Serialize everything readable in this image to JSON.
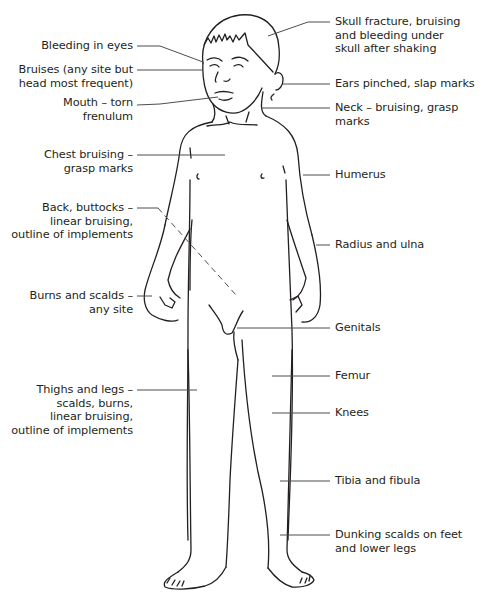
{
  "diagram": {
    "line_color": "#231f20",
    "leader_color": "#4d4d4d",
    "left_labels": [
      {
        "id": "bleeding-in-eyes",
        "lines": [
          "Bleeding in eyes"
        ]
      },
      {
        "id": "bruises",
        "lines": [
          "Bruises (any site but",
          "head most frequent)"
        ]
      },
      {
        "id": "mouth",
        "lines": [
          "Mouth – torn",
          "frenulum"
        ]
      },
      {
        "id": "chest",
        "lines": [
          "Chest bruising –",
          "grasp marks"
        ]
      },
      {
        "id": "back-buttocks",
        "lines": [
          "Back, buttocks –",
          "linear bruising,",
          "outline of implements"
        ]
      },
      {
        "id": "burns-scalds",
        "lines": [
          "Burns and scalds –",
          "any site"
        ]
      },
      {
        "id": "thighs-legs",
        "lines": [
          "Thighs and legs –",
          "scalds, burns,",
          "linear bruising,",
          "outline of implements"
        ]
      }
    ],
    "right_labels": [
      {
        "id": "skull",
        "lines": [
          "Skull fracture, bruising",
          "and bleeding under",
          "skull after shaking"
        ]
      },
      {
        "id": "ears",
        "lines": [
          "Ears pinched, slap marks"
        ]
      },
      {
        "id": "neck",
        "lines": [
          "Neck – bruising, grasp",
          "marks"
        ]
      },
      {
        "id": "humerus",
        "lines": [
          "Humerus"
        ]
      },
      {
        "id": "radius-ulna",
        "lines": [
          "Radius and ulna"
        ]
      },
      {
        "id": "genitals",
        "lines": [
          "Genitals"
        ]
      },
      {
        "id": "femur",
        "lines": [
          "Femur"
        ]
      },
      {
        "id": "knees",
        "lines": [
          "Knees"
        ]
      },
      {
        "id": "tibia-fibula",
        "lines": [
          "Tibia and fibula"
        ]
      },
      {
        "id": "dunking-scalds",
        "lines": [
          "Dunking scalds on feet",
          "and lower legs"
        ]
      }
    ]
  }
}
